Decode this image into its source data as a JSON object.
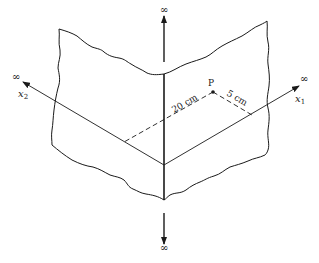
{
  "figure": {
    "infinity_symbols": {
      "top": "∞",
      "bottom": "∞",
      "x1_end": "∞",
      "x2_end": "∞"
    },
    "axes": {
      "x1": {
        "name": "x",
        "subscript": "1"
      },
      "x2": {
        "name": "x",
        "subscript": "2"
      }
    },
    "point": {
      "label": "P"
    },
    "dimensions": {
      "distance_parallel_x1": "20 cm",
      "distance_parallel_x2": "5 cm"
    },
    "colors": {
      "ink": "#1a1a1a",
      "background": "#ffffff"
    }
  }
}
